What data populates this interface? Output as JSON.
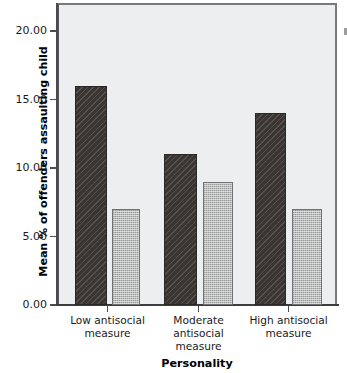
{
  "chart_data": {
    "type": "bar",
    "title": "",
    "xlabel": "Personality",
    "ylabel": "Mean % of offenders assaulting child",
    "categories": [
      "Low antisocial\nmeasure",
      "Moderate\nantisocial\nmeasure",
      "High antisocial\nmeasure"
    ],
    "series": [
      {
        "name": "dark-series",
        "values": [
          16.0,
          11.0,
          14.0
        ],
        "color": "#3a3532",
        "pattern": "diagonal-hatch"
      },
      {
        "name": "light-series",
        "values": [
          7.0,
          9.0,
          7.0
        ],
        "color": "#b9bbbb",
        "pattern": "checker-dots"
      }
    ],
    "ylim": [
      0.0,
      22.0
    ],
    "yticks": [
      0.0,
      5.0,
      10.0,
      15.0,
      20.0
    ],
    "ytick_labels": [
      "0.00",
      "5.00",
      "10.00",
      "15.00",
      "20.00"
    ],
    "grid": false,
    "legend": "cropped-off-right-edge",
    "plot_background": "#eceef0"
  },
  "axes": {
    "y_title": "Mean % of offenders assaulting child",
    "x_title": "Personality"
  },
  "bars": [
    {
      "group": 0,
      "series": 0,
      "value": 16.0,
      "x": 75,
      "width": 32
    },
    {
      "group": 0,
      "series": 1,
      "value": 7.0,
      "x": 112,
      "width": 28
    },
    {
      "group": 1,
      "series": 0,
      "value": 11.0,
      "x": 164,
      "width": 33
    },
    {
      "group": 1,
      "series": 1,
      "value": 9.0,
      "x": 203,
      "width": 30
    },
    {
      "group": 2,
      "series": 0,
      "value": 14.0,
      "x": 255,
      "width": 31
    },
    {
      "group": 2,
      "series": 1,
      "value": 7.0,
      "x": 292,
      "width": 30
    }
  ]
}
